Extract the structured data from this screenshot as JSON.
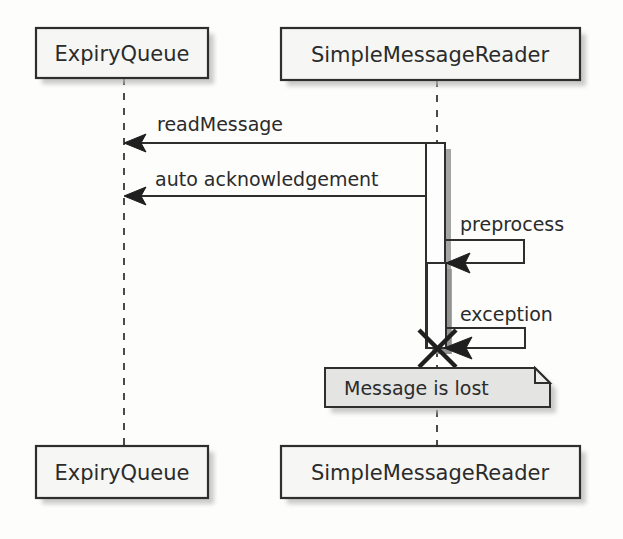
{
  "diagram": {
    "kind": "uml-sequence-diagram",
    "background_color": "#fdfdfc",
    "line_color": "#2e2e2e",
    "participant_fill": "#f6f6f4",
    "note_fill": "#e4e4e2",
    "shadow_color": "#b9b9b7"
  },
  "participants": [
    {
      "id": "expiry-queue",
      "label": "ExpiryQueue",
      "lifeline_x": 124,
      "head": {
        "x": 36,
        "y": 28,
        "w": 172,
        "h": 50
      },
      "foot": {
        "x": 36,
        "y": 446,
        "w": 172,
        "h": 52
      }
    },
    {
      "id": "simple-message-reader",
      "label": "SimpleMessageReader",
      "lifeline_x": 437,
      "head": {
        "x": 281,
        "y": 28,
        "w": 299,
        "h": 52
      },
      "foot": {
        "x": 281,
        "y": 446,
        "w": 299,
        "h": 52
      }
    }
  ],
  "activations": [
    {
      "id": "activation-outer",
      "x": 426,
      "y": 143,
      "w": 19,
      "h": 205
    },
    {
      "id": "activation-inner",
      "x": 427,
      "y": 263,
      "w": 19,
      "h": 85
    }
  ],
  "messages": [
    {
      "id": "read-message",
      "label": "readMessage",
      "from": "simple-message-reader",
      "to": "expiry-queue",
      "direction": "right-to-left",
      "y": 143,
      "label_x": 157,
      "label_y": 131
    },
    {
      "id": "auto-acknowledgement",
      "label": "auto acknowledgement",
      "from": "simple-message-reader",
      "to": "expiry-queue",
      "direction": "right-to-left",
      "y": 196,
      "label_x": 155,
      "label_y": 186
    },
    {
      "id": "preprocess",
      "label": "preprocess",
      "from": "simple-message-reader",
      "to": "simple-message-reader",
      "direction": "self",
      "top_y": 240,
      "bottom_y": 263,
      "right_x": 524,
      "label_x": 460,
      "label_y": 231
    },
    {
      "id": "exception",
      "label": "exception",
      "from": "simple-message-reader",
      "to": "simple-message-reader",
      "direction": "self",
      "top_y": 328,
      "bottom_y": 348,
      "right_x": 525,
      "label_x": 460,
      "label_y": 321
    }
  ],
  "destruction": {
    "id": "destroy-marker",
    "label": "X",
    "x": 437,
    "y": 348,
    "size": 19
  },
  "note": {
    "id": "message-lost-note",
    "label": "Message is lost",
    "x": 325,
    "y": 368,
    "w": 225,
    "h": 39,
    "fold": 15,
    "label_x": 344,
    "label_y": 395
  }
}
